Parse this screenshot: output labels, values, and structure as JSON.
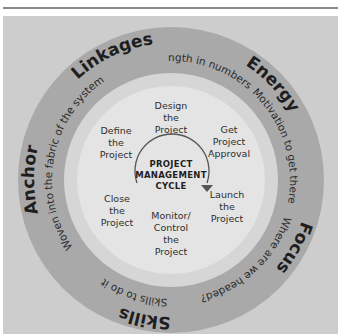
{
  "diagram": {
    "center_title": [
      "PROJECT",
      "MANAGEMENT",
      "CYCLE"
    ],
    "cycle_steps": [
      {
        "id": "design",
        "lines": [
          "Design",
          "the",
          "Project"
        ]
      },
      {
        "id": "approval",
        "lines": [
          "Get",
          "Project",
          "Approval"
        ]
      },
      {
        "id": "launch",
        "lines": [
          "Launch",
          "the",
          "Project"
        ]
      },
      {
        "id": "monitor",
        "lines": [
          "Monitor/",
          "Control",
          "the",
          "Project"
        ]
      },
      {
        "id": "close",
        "lines": [
          "Close",
          "the",
          "Project"
        ]
      },
      {
        "id": "define",
        "lines": [
          "Define",
          "the",
          "Project"
        ]
      }
    ],
    "outer_ring": [
      {
        "id": "linkages",
        "label": "Linkages",
        "tagline": "Strength in numbers"
      },
      {
        "id": "energy",
        "label": "Energy",
        "tagline": "Motivation to get there"
      },
      {
        "id": "focus",
        "label": "Focus",
        "tagline": "Where are we headed?"
      },
      {
        "id": "skills",
        "label": "Skills",
        "tagline": "Skills to do it"
      },
      {
        "id": "anchor",
        "label": "Anchor",
        "tagline": "Woven into the fabric of the system"
      }
    ],
    "colors": {
      "panel": "#cdcdcd",
      "outer_ring": "#a9a9a9",
      "middle_band": "#d6d6d6",
      "inner_disk": "#e4e4e4",
      "arrow": "#555555"
    }
  }
}
